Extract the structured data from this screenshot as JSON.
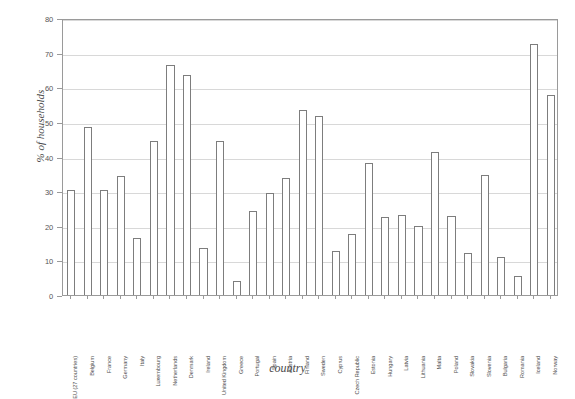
{
  "chart_data": {
    "type": "bar",
    "title": "",
    "subtitle": "",
    "xlabel": "country",
    "ylabel": "% of households",
    "ylim": [
      0,
      80
    ],
    "ytick_step": 10,
    "yticks": [
      "0",
      "10",
      "20",
      "30",
      "40",
      "50",
      "60",
      "70",
      "80"
    ],
    "grid": true,
    "legend": "none",
    "bar_style": {
      "fill": "#ffffff",
      "edge": "#7d7d7d"
    },
    "categories": [
      "EU (27 countries)",
      "Belgium",
      "France",
      "Germany",
      "Italy",
      "Luxembourg",
      "Netherlands",
      "Denmark",
      "Ireland",
      "United Kingdom",
      "Greece",
      "Portugal",
      "Spain",
      "Austria",
      "Finland",
      "Sweden",
      "Cyprus",
      "Czech Republic",
      "Estonia",
      "Hungary",
      "Latvia",
      "Lithuania",
      "Malta",
      "Poland",
      "Slovakia",
      "Slovenia",
      "Bulgaria",
      "Romania",
      "Iceland",
      "Norway"
    ],
    "values": [
      30.3,
      48.5,
      30.3,
      34.3,
      16.5,
      44.5,
      66.5,
      63.5,
      13.5,
      44.5,
      4.0,
      24.3,
      29.4,
      33.7,
      53.3,
      51.7,
      12.8,
      17.5,
      38.0,
      22.5,
      23.0,
      19.8,
      41.2,
      22.7,
      12.2,
      34.7,
      11.0,
      5.5,
      72.5,
      57.8
    ]
  }
}
